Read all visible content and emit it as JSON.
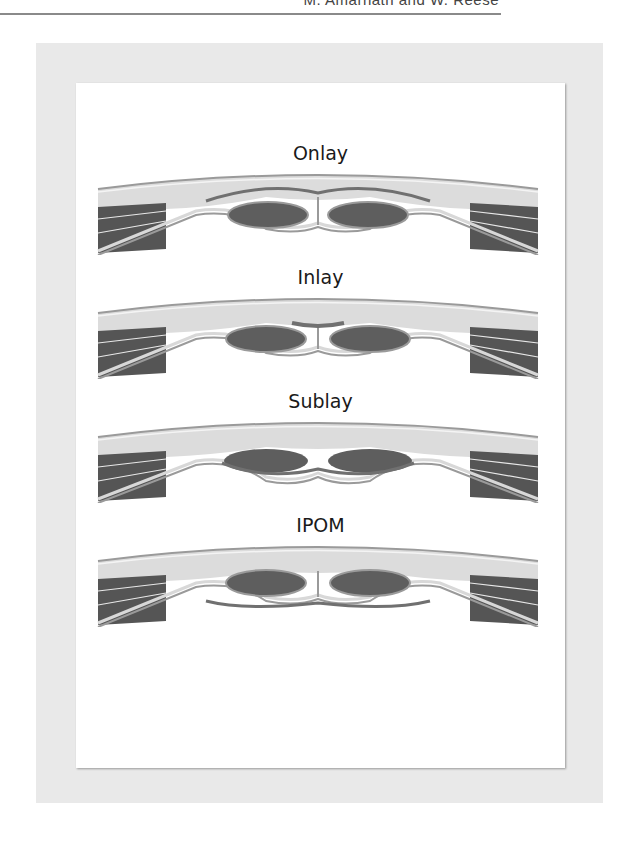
{
  "page": {
    "running_header": "M. Amarnath and W. Reese"
  },
  "figure": {
    "panels": [
      {
        "label": "Onlay",
        "mesh_position": "onlay"
      },
      {
        "label": "Inlay",
        "mesh_position": "inlay"
      },
      {
        "label": "Sublay",
        "mesh_position": "sublay"
      },
      {
        "label": "IPOM",
        "mesh_position": "ipom"
      }
    ],
    "colors": {
      "frame": "#e9e9e9",
      "panel": "#ffffff",
      "subcutaneous": "#dcdcdc",
      "fascia_line": "#9a9a9a",
      "rectus_muscle": "#5e5e5e",
      "lateral_muscle": "#555555",
      "mesh": "#707070"
    }
  }
}
